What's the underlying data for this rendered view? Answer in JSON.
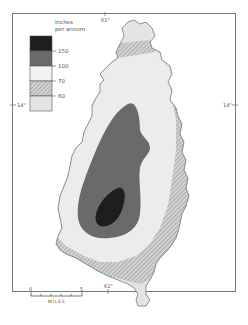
{
  "legend": {
    "title_line1": "Inches",
    "title_line2": "per annum",
    "classes": [
      {
        "label": "150",
        "color": "#1e1e1e",
        "pattern": "solid",
        "range": ">150"
      },
      {
        "label": "100",
        "color": "#6a6a6a",
        "pattern": "solid",
        "range": "100-150"
      },
      {
        "label": "70",
        "color": "#ececec",
        "pattern": "solid",
        "range": "70-100"
      },
      {
        "label": "60",
        "color": "#bdbdbd",
        "pattern": "hatched",
        "range": "60-70"
      },
      {
        "label": "",
        "color": "#e4e4e4",
        "pattern": "solid",
        "range": "<60"
      }
    ]
  },
  "graticule": {
    "longitude_top": "61°",
    "longitude_bottom": "61°",
    "latitude_left": "14°",
    "latitude_right": "14°"
  },
  "scale_bar": {
    "start": "0",
    "end": "5",
    "unit": "MILES"
  }
}
